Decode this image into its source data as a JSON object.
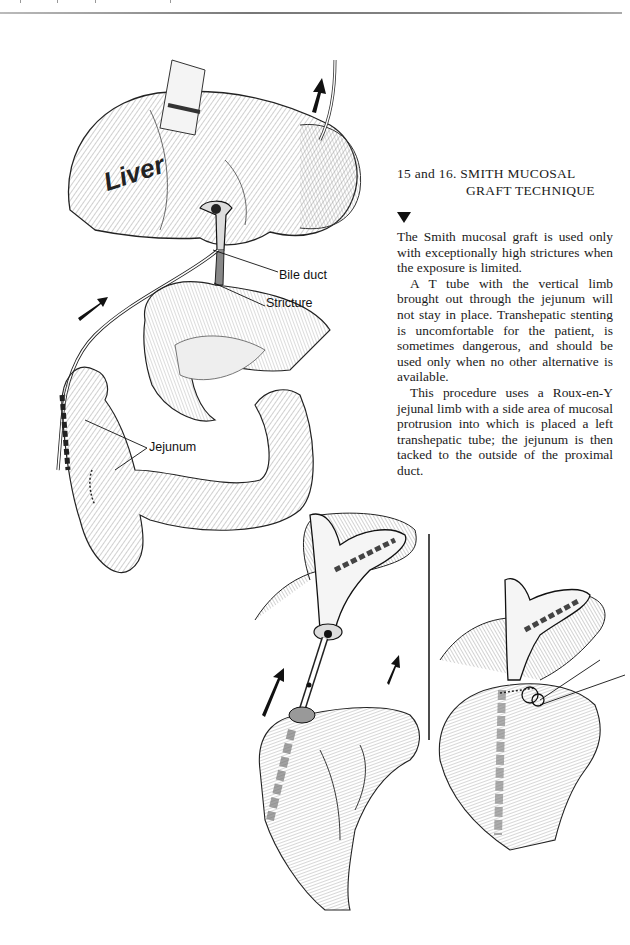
{
  "page": {
    "section_heading_line1": "15 and 16. SMITH MUCOSAL",
    "section_heading_line2": "GRAFT TECHNIQUE",
    "marker_icon": "down-triangle-icon",
    "paragraphs": [
      "The Smith mucosal graft is used only with exceptionally high strictures when the exposure is limited.",
      "A T tube with the vertical limb brought out through the jejunum will not stay in place. Transhepatic stent­ing is uncomfortable for the patient, is sometimes dangerous, and should be used only when no other alterna­tive is available.",
      "This procedure uses a Roux-en-Y jejunal limb with a side area of mu­cosal protrusion into which is placed a left transhepatic tube; the jejunum is then tacked to the outside of the proximal duct."
    ]
  },
  "figure_15": {
    "organ_label": "Liver",
    "callouts": {
      "bile_duct": "Bile duct",
      "stricture": "Stricture",
      "jejunum": "Jejunum"
    }
  },
  "figure_16": {
    "panels": [
      "tube-placement",
      "tacked-anastomosis"
    ]
  },
  "colors": {
    "ink": "#111111",
    "paper": "#ffffff",
    "hatch": "#555555"
  }
}
